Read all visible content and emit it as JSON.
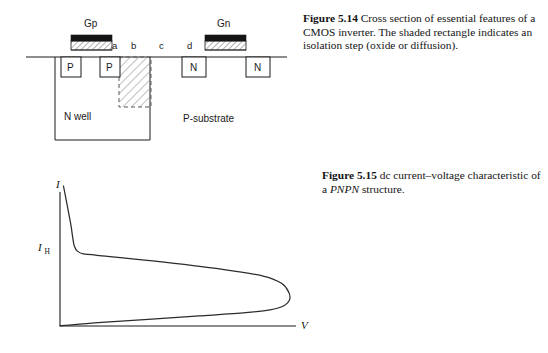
{
  "figures": [
    {
      "id": "fig-5-14",
      "caption_label": "Figure 5.14",
      "caption_text": "Cross section of essential features of a CMOS inverter. The shaded rectangle indicates an isolation step (oxide or diffusion).",
      "diagram": {
        "type": "cmos-inverter-cross-section",
        "gates": [
          {
            "name": "gate-p",
            "label": "Gp"
          },
          {
            "name": "gate-n",
            "label": "Gn"
          }
        ],
        "diffusions": [
          {
            "name": "p-source",
            "label": "P"
          },
          {
            "name": "p-drain",
            "label": "P"
          },
          {
            "name": "n-source",
            "label": "N"
          },
          {
            "name": "n-drain",
            "label": "N"
          }
        ],
        "point_labels": [
          "a",
          "b",
          "c",
          "d"
        ],
        "regions": [
          {
            "name": "n-well",
            "label": "N well"
          },
          {
            "name": "p-substrate",
            "label": "P-substrate"
          }
        ],
        "isolation_note": "hatched rectangle = isolation step (oxide or diffusion)",
        "colors": {
          "gate_fill": "#141414",
          "stroke": "#1a1a1a",
          "hatch": "#777777"
        }
      }
    },
    {
      "id": "fig-5-15",
      "caption_label": "Figure 5.15",
      "caption_text_pre": "dc current–voltage characteristic of a ",
      "caption_text_italic": "PNPN",
      "caption_text_post": " structure.",
      "chart_data": {
        "type": "line",
        "title": "dc current-voltage characteristic of a PNPN structure",
        "xlabel": "V",
        "ylabel": "I",
        "grid": false,
        "legend": false,
        "annotations": [
          {
            "name": "holding-current",
            "label": "I",
            "sublabel": "H",
            "description": "Holding current level marked on the I axis"
          }
        ],
        "axis_ranges": {
          "xlim": [
            0,
            1
          ],
          "ylim": [
            0,
            1
          ]
        },
        "series": [
          {
            "name": "S-shaped PNPN characteristic",
            "description": "Negative-resistance S curve: rises steeply from origin along low-current blocking branch to a switching knee, folds back to the holding point I_H, then the on-state branch sweeps to high voltage and returns toward the origin.",
            "points": [
              [
                0.015,
                1.0
              ],
              [
                0.045,
                0.74
              ],
              [
                0.055,
                0.63
              ],
              [
                0.062,
                0.57
              ],
              [
                0.075,
                0.535
              ],
              [
                0.1,
                0.515
              ],
              [
                0.16,
                0.505
              ],
              [
                0.4,
                0.465
              ],
              [
                0.7,
                0.405
              ],
              [
                0.88,
                0.355
              ],
              [
                0.955,
                0.305
              ],
              [
                0.985,
                0.245
              ],
              [
                0.99,
                0.19
              ],
              [
                0.965,
                0.145
              ],
              [
                0.905,
                0.115
              ],
              [
                0.8,
                0.095
              ],
              [
                0.6,
                0.072
              ],
              [
                0.38,
                0.048
              ],
              [
                0.18,
                0.026
              ],
              [
                0.02,
                0.004
              ],
              [
                0.0,
                0.0
              ]
            ]
          }
        ]
      }
    }
  ]
}
